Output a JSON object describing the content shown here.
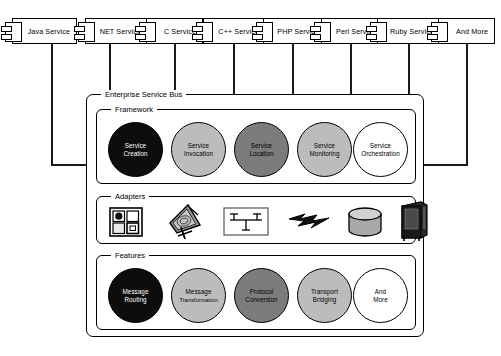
{
  "diagram": {
    "esb_label": "Enterprise Service Bus",
    "sections": {
      "framework_label": "Framework",
      "adapters_label": "Adapters",
      "features_label": "Features"
    }
  },
  "services": [
    {
      "label": "Java Service",
      "icon": "uml-component-icon"
    },
    {
      "label": "NET Service",
      "icon": "uml-component-icon"
    },
    {
      "label": "C Service",
      "icon": "uml-component-icon"
    },
    {
      "label": "C++ Service",
      "icon": "uml-component-icon"
    },
    {
      "label": "PHP Service",
      "icon": "uml-component-icon"
    },
    {
      "label": "Perl Service",
      "icon": "uml-component-icon"
    },
    {
      "label": "Ruby Service",
      "icon": "uml-component-icon"
    },
    {
      "label": "And More",
      "icon": "uml-component-icon"
    }
  ],
  "framework": [
    {
      "line1": "Service",
      "line2": "Creation",
      "fill": "#0d0d0d",
      "text": "#ffffff"
    },
    {
      "line1": "Service",
      "line2": "Invocation",
      "fill": "#bcbcbc",
      "text": "#000000"
    },
    {
      "line1": "Service",
      "line2": "Location",
      "fill": "#7c7c7c",
      "text": "#000000"
    },
    {
      "line1": "Service",
      "line2": "Monitoring",
      "fill": "#bcbcbc",
      "text": "#000000"
    },
    {
      "line1": "Service",
      "line2": "Orchestration",
      "fill": "#ffffff",
      "text": "#000000"
    }
  ],
  "adapters": [
    {
      "name": "connector-grid-icon"
    },
    {
      "name": "satellite-dish-icon"
    },
    {
      "name": "network-diagram-icon"
    },
    {
      "name": "lightning-bolt-icon"
    },
    {
      "name": "database-cylinder-icon"
    },
    {
      "name": "server-rack-icon"
    }
  ],
  "features": [
    {
      "line1": "Message",
      "line2": "Routing",
      "fill": "#0d0d0d",
      "text": "#ffffff"
    },
    {
      "line1": "Message",
      "line2": "Transformation",
      "fill": "#bcbcbc",
      "text": "#000000"
    },
    {
      "line1": "Protocol",
      "line2": "Conversion",
      "fill": "#7c7c7c",
      "text": "#000000"
    },
    {
      "line1": "Transport",
      "line2": "Bridging",
      "fill": "#bcbcbc",
      "text": "#000000"
    },
    {
      "line1": "And",
      "line2": "More",
      "fill": "#ffffff",
      "text": "#000000"
    }
  ],
  "colors": {
    "stroke": "#000000",
    "canvas": "#ffffff",
    "dark": "#0d0d0d",
    "mid": "#7c7c7c",
    "light": "#bcbcbc"
  }
}
